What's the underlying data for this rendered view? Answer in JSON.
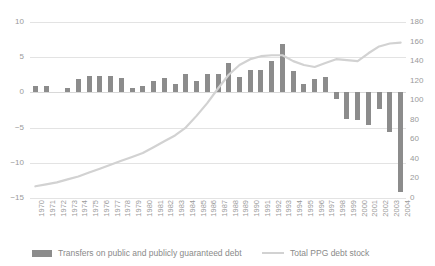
{
  "chart_data": {
    "type": "bar",
    "title": "",
    "subtitle": "",
    "xlabel": "",
    "ylabel": "",
    "y2label": "",
    "grid": true,
    "legend_position": "bottom",
    "categories": [
      "1970",
      "1971",
      "1972",
      "1973",
      "1974",
      "1975",
      "1976",
      "1977",
      "1978",
      "1979",
      "1980",
      "1981",
      "1982",
      "1983",
      "1984",
      "1985",
      "1986",
      "1987",
      "1988",
      "1989",
      "1990",
      "1991",
      "1992",
      "1993",
      "1994",
      "1995",
      "1996",
      "1997",
      "1998",
      "1999",
      "2000",
      "2001",
      "2002",
      "2003",
      "2004"
    ],
    "ylim": [
      -15,
      10
    ],
    "yticks": [
      10,
      5,
      0,
      -5,
      -10,
      -15
    ],
    "y2lim": [
      0,
      180
    ],
    "y2ticks": [
      180,
      160,
      140,
      120,
      100,
      80,
      60,
      40,
      20,
      0
    ],
    "series": [
      {
        "name": "Transfers on public and publicly guaranteed debt",
        "type": "bar",
        "axis": "left",
        "color": "#8c8c8c",
        "values": [
          0.9,
          0.9,
          0.0,
          0.6,
          1.9,
          2.3,
          2.3,
          2.3,
          2.0,
          0.6,
          0.9,
          1.6,
          2.0,
          1.2,
          2.6,
          1.6,
          2.6,
          2.6,
          4.2,
          2.2,
          3.2,
          3.2,
          4.4,
          6.9,
          3.0,
          1.2,
          1.9,
          2.2,
          -0.9,
          -3.8,
          -3.9,
          -4.6,
          -2.4,
          -5.6,
          -14.1
        ]
      },
      {
        "name": "Total PPG debt stock",
        "type": "line",
        "axis": "right",
        "color": "#d2d2d2",
        "values": [
          12,
          14,
          16,
          19,
          22,
          26,
          30,
          34,
          38,
          42,
          46,
          52,
          58,
          64,
          72,
          84,
          97,
          112,
          126,
          136,
          142,
          145,
          146,
          146,
          140,
          136,
          134,
          138,
          142,
          141,
          140,
          148,
          155,
          158,
          159
        ]
      }
    ]
  },
  "legend": {
    "bars_label": "Transfers on public and publicly guaranteed debt",
    "line_label": "Total PPG debt stock"
  }
}
